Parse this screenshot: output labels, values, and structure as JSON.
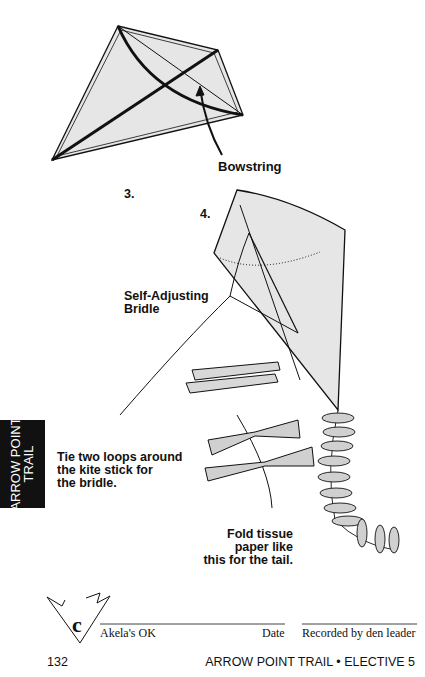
{
  "labels": {
    "bowstring": "Bowstring",
    "step3": "3.",
    "step4": "4.",
    "bridle_line1": "Self-Adjusting",
    "bridle_line2": "Bridle",
    "loops_line1": "Tie two loops around",
    "loops_line2": "the kite stick for",
    "loops_line3": "the bridle.",
    "tail_line1": "Fold tissue",
    "tail_line2": "paper like",
    "tail_line3": "this for the tail."
  },
  "side_tab": {
    "line1": "ARROW POINT",
    "line2": "TRAIL"
  },
  "signoff": {
    "badge_letter": "c",
    "akela": "Akela's OK",
    "date": "Date",
    "recorded": "Recorded by den leader"
  },
  "footer": {
    "page_number": "132",
    "section": "ARROW POINT TRAIL • ELECTIVE 5"
  },
  "colors": {
    "kite_fill": "#e6e6e6",
    "ink": "#111111",
    "tab_bg": "#111111"
  }
}
